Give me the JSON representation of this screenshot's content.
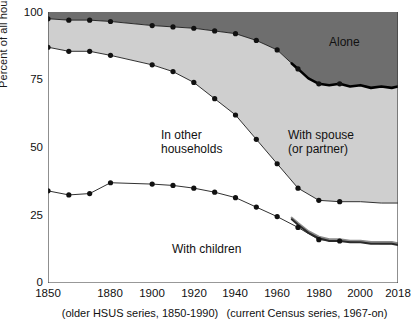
{
  "chart_data": {
    "type": "area",
    "title": "",
    "subtitle": "",
    "xlabel": "",
    "ylabel": "Percent of all households",
    "xlim": [
      1850,
      2018
    ],
    "ylim": [
      0,
      100
    ],
    "grid": false,
    "legend_position": "inline-annotations",
    "xticks": [
      1850,
      1880,
      1900,
      1920,
      1940,
      1960,
      1980,
      2000,
      2018
    ],
    "xtick_labels": [
      "1850",
      "1880",
      "1900",
      "1920",
      "1940",
      "1960",
      "1980",
      "2000",
      "2018"
    ],
    "yticks": [
      0,
      25,
      50,
      75,
      100
    ],
    "ytick_labels": [
      "0",
      "25",
      "50",
      "75",
      "100"
    ],
    "annotations": [
      {
        "name": "alone",
        "text": "Alone",
        "x": 1985,
        "y": 89
      },
      {
        "name": "in-other-households",
        "text": "In other\nhouseholds",
        "line1": "In other",
        "line2": "households",
        "x": 1898,
        "y": 55
      },
      {
        "name": "with-spouse",
        "text": "With spouse\n(or partner)",
        "line1": "With spouse",
        "line2": "(or partner)",
        "x": 1963,
        "y": 55
      },
      {
        "name": "with-children",
        "text": "With children",
        "x": 1905,
        "y": 13
      }
    ],
    "footnotes": {
      "left": "(older HSUS series, 1850-1990)",
      "right": "(current Census series, 1967-on)"
    },
    "colors": {
      "alone_fill": "#6e6e6e",
      "spouse_fill": "#cfcfcf",
      "in_other_fill": "#ffffff",
      "line": "#1a1a1a",
      "marker": "#111111",
      "census_overlay": "#8c8c8c",
      "axis": "#333333",
      "background": "#ffffff"
    },
    "series": [
      {
        "name": "Alone (cumulative top of With-spouse band)",
        "role": "boundary-spouse-top",
        "note": "Upper boundary of the 'With spouse (or partner)' band; area above it up to 100 is 'Alone'.",
        "x": [
          1850,
          1860,
          1870,
          1880,
          1900,
          1910,
          1920,
          1930,
          1940,
          1950,
          1960,
          1967,
          1970,
          1975,
          1980,
          1985,
          1990,
          1995,
          2000,
          2005,
          2010,
          2015,
          2018
        ],
        "values": [
          97.5,
          97.0,
          97.0,
          96.5,
          95.0,
          94.5,
          94.0,
          93.0,
          92.0,
          89.5,
          86.0,
          81.0,
          79.0,
          75.5,
          73.5,
          73.0,
          73.5,
          72.5,
          73.0,
          72.0,
          72.5,
          72.0,
          72.5
        ]
      },
      {
        "name": "With spouse (or partner) lower boundary",
        "role": "boundary-inother-top",
        "note": "Lower boundary of the 'With spouse' band; area below it is 'In other households'.",
        "x": [
          1850,
          1860,
          1870,
          1880,
          1900,
          1910,
          1920,
          1930,
          1940,
          1950,
          1960,
          1970,
          1980,
          1990,
          2000,
          2010,
          2018
        ],
        "values": [
          87.0,
          85.5,
          85.5,
          84.0,
          80.5,
          78.0,
          74.0,
          68.0,
          62.0,
          53.0,
          44.0,
          35.0,
          30.5,
          30.0,
          30.0,
          29.5,
          29.5
        ]
      },
      {
        "name": "With children",
        "role": "line",
        "x": [
          1850,
          1860,
          1870,
          1880,
          1900,
          1910,
          1920,
          1930,
          1940,
          1950,
          1960,
          1970,
          1980,
          1990,
          2000,
          2010,
          2018
        ],
        "values": [
          34.0,
          32.5,
          33.0,
          37.0,
          36.5,
          36.0,
          35.0,
          33.5,
          31.5,
          28.0,
          24.5,
          20.5,
          16.0,
          15.5,
          15.0,
          14.5,
          14.5
        ]
      },
      {
        "name": "With children (current Census series, 1967-on)",
        "role": "overlay-line",
        "x": [
          1967,
          1970,
          1975,
          1980,
          1985,
          1990,
          1995,
          2000,
          2005,
          2010,
          2015,
          2018
        ],
        "values": [
          23.5,
          21.5,
          18.5,
          16.5,
          15.5,
          15.5,
          15.0,
          15.0,
          14.5,
          14.5,
          14.5,
          14.0
        ]
      }
    ],
    "markers": {
      "note": "Filled black circles mark decadal HSUS observations on all three boundaries."
    }
  },
  "axis": {
    "ylabel": "Percent of all households"
  }
}
